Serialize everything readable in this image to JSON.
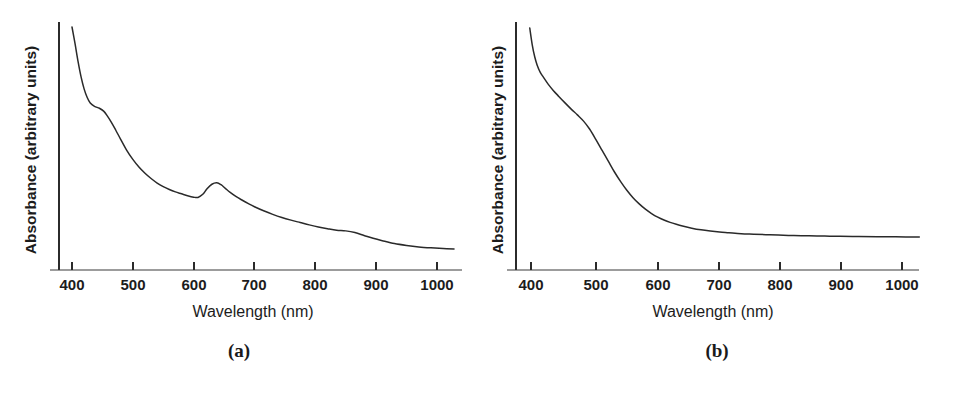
{
  "figure": {
    "background_color": "#ffffff",
    "line_color": "#2a2a2a",
    "axis_color": "#2b2b2b"
  },
  "panels": [
    {
      "id": "a",
      "caption": "(a)",
      "xlabel": "Wavelength (nm)",
      "ylabel": "Absorbance (arbitrary units)"
    },
    {
      "id": "b",
      "caption": "(b)",
      "xlabel": "Wavelength (nm)",
      "ylabel": "Absorbance (arbitrary units)"
    }
  ],
  "chart_data": [
    {
      "type": "line",
      "title": "(a)",
      "xlabel": "Wavelength (nm)",
      "ylabel": "Absorbance (arbitrary units)",
      "xlim": [
        375,
        1030
      ],
      "ylim": [
        0,
        1
      ],
      "grid": false,
      "legend": null,
      "xticks": [
        400,
        500,
        600,
        700,
        800,
        900,
        1000
      ],
      "xtick_labels": [
        "400",
        "500",
        "600",
        "700",
        "800",
        "900",
        "1000"
      ],
      "yticks": [],
      "ytick_labels": [],
      "annotations": [
        "shoulder near 450 nm",
        "local minimum near 605 nm",
        "absorption peak near 640 nm",
        "shoulder near 850 nm"
      ],
      "series": [
        {
          "name": "absorbance-a",
          "x": [
            400,
            405,
            410,
            415,
            420,
            425,
            430,
            437,
            445,
            452,
            458,
            465,
            472,
            480,
            490,
            500,
            510,
            520,
            530,
            540,
            550,
            560,
            570,
            580,
            590,
            600,
            607,
            615,
            622,
            630,
            638,
            645,
            652,
            660,
            670,
            680,
            690,
            700,
            715,
            730,
            745,
            760,
            775,
            790,
            805,
            820,
            835,
            850,
            865,
            880,
            895,
            910,
            930,
            950,
            970,
            990,
            1010,
            1028
          ],
          "y": [
            1.0,
            0.93,
            0.855,
            0.79,
            0.74,
            0.705,
            0.682,
            0.668,
            0.66,
            0.648,
            0.628,
            0.6,
            0.568,
            0.53,
            0.484,
            0.446,
            0.414,
            0.388,
            0.366,
            0.347,
            0.332,
            0.32,
            0.31,
            0.302,
            0.294,
            0.288,
            0.287,
            0.3,
            0.323,
            0.342,
            0.348,
            0.34,
            0.325,
            0.308,
            0.29,
            0.275,
            0.261,
            0.248,
            0.231,
            0.216,
            0.203,
            0.192,
            0.182,
            0.172,
            0.163,
            0.156,
            0.15,
            0.147,
            0.14,
            0.128,
            0.116,
            0.106,
            0.094,
            0.086,
            0.08,
            0.076,
            0.073,
            0.071
          ]
        }
      ]
    },
    {
      "type": "line",
      "title": "(b)",
      "xlabel": "Wavelength (nm)",
      "ylabel": "Absorbance (arbitrary units)",
      "xlim": [
        375,
        1030
      ],
      "ylim": [
        0,
        1
      ],
      "grid": false,
      "legend": null,
      "xticks": [
        400,
        500,
        600,
        700,
        800,
        900,
        1000
      ],
      "xtick_labels": [
        "400",
        "500",
        "600",
        "700",
        "800",
        "900",
        "1000"
      ],
      "yticks": [],
      "ytick_labels": [],
      "annotations": [
        "steep decay from 400 nm",
        "slight shoulder near 480 nm",
        "flat tail beyond 700 nm"
      ],
      "series": [
        {
          "name": "absorbance-b",
          "x": [
            398,
            402,
            406,
            410,
            415,
            420,
            428,
            436,
            445,
            455,
            465,
            475,
            485,
            495,
            505,
            515,
            525,
            535,
            545,
            555,
            565,
            575,
            585,
            595,
            605,
            615,
            625,
            635,
            645,
            660,
            675,
            690,
            705,
            720,
            740,
            760,
            780,
            800,
            825,
            850,
            875,
            900,
            930,
            960,
            990,
            1028
          ],
          "y": [
            1.0,
            0.93,
            0.88,
            0.845,
            0.815,
            0.795,
            0.765,
            0.74,
            0.715,
            0.688,
            0.662,
            0.638,
            0.612,
            0.578,
            0.535,
            0.49,
            0.445,
            0.4,
            0.36,
            0.324,
            0.293,
            0.267,
            0.245,
            0.227,
            0.212,
            0.2,
            0.19,
            0.182,
            0.175,
            0.166,
            0.159,
            0.154,
            0.15,
            0.147,
            0.143,
            0.141,
            0.139,
            0.137,
            0.135,
            0.134,
            0.133,
            0.132,
            0.131,
            0.13,
            0.13,
            0.129
          ]
        }
      ]
    }
  ]
}
